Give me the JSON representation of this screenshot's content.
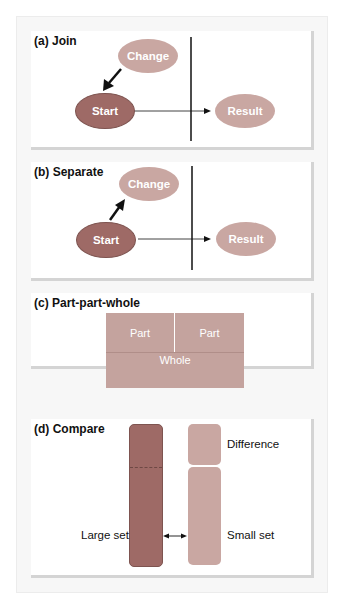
{
  "panels": {
    "a": {
      "title": "(a) Join",
      "change": "Change",
      "start": "Start",
      "result": "Result"
    },
    "b": {
      "title": "(b) Separate",
      "change": "Change",
      "start": "Start",
      "result": "Result"
    },
    "c": {
      "title": "(c) Part-part-whole",
      "part1": "Part",
      "part2": "Part",
      "whole": "Whole"
    },
    "d": {
      "title": "(d) Compare",
      "difference": "Difference",
      "large_set": "Large set",
      "small_set": "Small set"
    }
  },
  "colors": {
    "start": "#9e6a66",
    "change_result": "#c9a7a2",
    "part_whole": "#c4a39e",
    "large_set": "#9e6a66",
    "small_set": "#c9a7a2"
  }
}
